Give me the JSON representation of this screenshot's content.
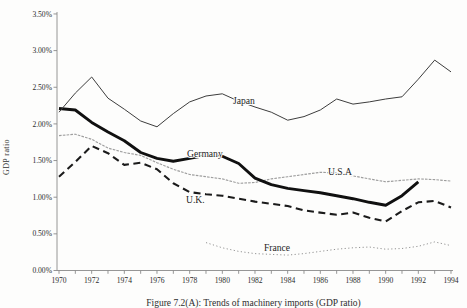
{
  "figure": {
    "caption": "Figure 7.2(A): Trends of machinery imports (GDP ratio)"
  },
  "chart_data": {
    "type": "line",
    "title": "",
    "xlabel": "",
    "ylabel": "GDP ratio",
    "xlim": [
      1970,
      1994
    ],
    "ylim": [
      0,
      3.5
    ],
    "grid": false,
    "legend": "inline-labels",
    "y_tick_labels": [
      "3.50%",
      "3.00%",
      "2.50%",
      "2.00%",
      "1.50%",
      "1.00%",
      "0.50%",
      "0.00%"
    ],
    "x_tick_labels": [
      "1970",
      "1972",
      "1974",
      "1976",
      "1978",
      "1980",
      "1982",
      "1984",
      "1986",
      "1988",
      "1990",
      "1992",
      "1994"
    ],
    "series": [
      {
        "name": "U.S.A",
        "label": "U.S.A",
        "line_style": "gray-dash",
        "color": "#9e9e9e",
        "x_start": 1970,
        "values": [
          1.84,
          1.86,
          1.79,
          1.67,
          1.61,
          1.57,
          1.47,
          1.38,
          1.31,
          1.28,
          1.25,
          1.19,
          1.2,
          1.25,
          1.28,
          1.31,
          1.34,
          1.33,
          1.29,
          1.25,
          1.21,
          1.23,
          1.25,
          1.24,
          1.22
        ],
        "label_x": 328,
        "label_y": 175
      },
      {
        "name": "France",
        "label": "France",
        "line_style": "fine-dot",
        "color": "#8d8d8d",
        "x_start": 1979,
        "values": [
          0.38,
          0.31,
          0.26,
          0.23,
          0.22,
          0.21,
          0.23,
          0.26,
          0.29,
          0.31,
          0.32,
          0.29,
          0.3,
          0.33,
          0.39,
          0.34
        ],
        "label_x": 264,
        "label_y": 251
      },
      {
        "name": "U.K.",
        "label": "U.K.",
        "line_style": "dashed",
        "color": "#1b1b1b",
        "x_start": 1970,
        "values": [
          1.28,
          1.48,
          1.7,
          1.6,
          1.44,
          1.47,
          1.38,
          1.19,
          1.07,
          1.04,
          1.02,
          0.98,
          0.94,
          0.91,
          0.88,
          0.82,
          0.79,
          0.76,
          0.79,
          0.72,
          0.67,
          0.81,
          0.93,
          0.95,
          0.86
        ],
        "label_x": 186,
        "label_y": 203
      },
      {
        "name": "Germany",
        "label": "Germany",
        "line_style": "solid-thick",
        "color": "#101010",
        "x_start": 1970,
        "values": [
          2.21,
          2.19,
          2.02,
          1.89,
          1.77,
          1.61,
          1.53,
          1.49,
          1.53,
          1.57,
          1.56,
          1.46,
          1.26,
          1.17,
          1.12,
          1.09,
          1.06,
          1.02,
          0.98,
          0.93,
          0.89,
          1.02,
          1.21
        ],
        "label_x": 187,
        "label_y": 157
      },
      {
        "name": "Japan",
        "label": "Japan",
        "line_style": "solid-thin",
        "color": "#3d3d3d",
        "x_start": 1970,
        "values": [
          2.16,
          2.42,
          2.64,
          2.35,
          2.2,
          2.04,
          1.96,
          2.14,
          2.3,
          2.38,
          2.41,
          2.31,
          2.23,
          2.16,
          2.05,
          2.1,
          2.19,
          2.34,
          2.27,
          2.3,
          2.34,
          2.37,
          2.61,
          2.87,
          2.71
        ],
        "label_x": 233,
        "label_y": 104
      }
    ]
  }
}
